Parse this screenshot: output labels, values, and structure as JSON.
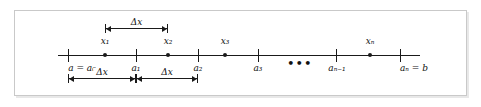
{
  "figure": {
    "kind": "number-line-partition-diagram",
    "caption": "",
    "axis": {
      "line_color": "#1a1a1a",
      "start_px": 58,
      "end_px": 420
    },
    "ellipsis": "•••",
    "ticks": [
      {
        "id": "a0",
        "label": "a = a0",
        "label_html": "a = a₀",
        "x": 68,
        "position": "below"
      },
      {
        "id": "a1",
        "label": "a1",
        "label_html": "a₁",
        "x": 136,
        "position": "below"
      },
      {
        "id": "a2",
        "label": "a2",
        "label_html": "a₂",
        "x": 198,
        "position": "below"
      },
      {
        "id": "a3",
        "label": "a3",
        "label_html": "a₃",
        "x": 258,
        "position": "below"
      },
      {
        "id": "an1",
        "label": "an-1",
        "label_html": "aₙ₋₁",
        "x": 336,
        "position": "below"
      },
      {
        "id": "an",
        "label": "an = b",
        "label_html": "aₙ = b",
        "x": 400,
        "position": "below"
      }
    ],
    "sample_points": [
      {
        "id": "x1",
        "label": "x1",
        "label_html": "x₁",
        "x": 105,
        "position": "above"
      },
      {
        "id": "x2",
        "label": "x2",
        "label_html": "x₂",
        "x": 168,
        "position": "above"
      },
      {
        "id": "x3",
        "label": "x3",
        "label_html": "x₃",
        "x": 225,
        "position": "above"
      },
      {
        "id": "xn",
        "label": "xn",
        "label_html": "xₙ",
        "x": 370,
        "position": "above"
      }
    ],
    "measurements": [
      {
        "id": "delta-x-top",
        "label": "Δx",
        "from_px": 105,
        "to_px": 168,
        "y_px": 24,
        "placement": "above"
      },
      {
        "id": "delta-x-bottom-1",
        "label": "Δx",
        "from_px": 68,
        "to_px": 136,
        "y_px": 74,
        "placement": "below"
      },
      {
        "id": "delta-x-bottom-2",
        "label": "Δx",
        "from_px": 136,
        "to_px": 198,
        "y_px": 74,
        "placement": "below"
      }
    ]
  },
  "colors": {
    "ink": "#1a1a1a",
    "frame": "#c9c9c9",
    "background": "#ffffff"
  }
}
